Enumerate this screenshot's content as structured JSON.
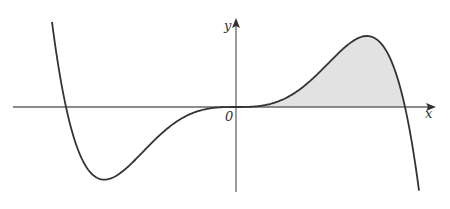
{
  "figure": {
    "labels": {
      "x_axis": "x",
      "y_axis": "y",
      "origin": "0"
    },
    "colors": {
      "curve": "#333333",
      "axis": "#666666",
      "shade": "#e2e2e2"
    },
    "curve": {
      "form": "y = -k * x^3 * (x + a) * (x - b)",
      "left_root_px": 66,
      "origin_px": [
        236,
        107
      ],
      "right_root_px": 405,
      "local_min_px": [
        113,
        176
      ],
      "local_max_px": [
        361,
        37
      ]
    },
    "shaded_region": {
      "from": "0",
      "to": "right root",
      "side": "above x-axis"
    }
  }
}
